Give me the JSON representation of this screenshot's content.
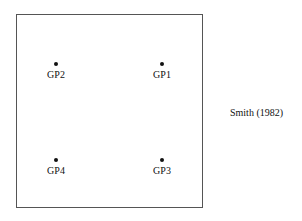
{
  "diagram": {
    "citation": "Smith (1982)",
    "points": [
      {
        "label": "GP1",
        "x": 162,
        "y": 64
      },
      {
        "label": "GP2",
        "x": 56,
        "y": 64
      },
      {
        "label": "GP3",
        "x": 162,
        "y": 160
      },
      {
        "label": "GP4",
        "x": 56,
        "y": 160
      }
    ]
  }
}
